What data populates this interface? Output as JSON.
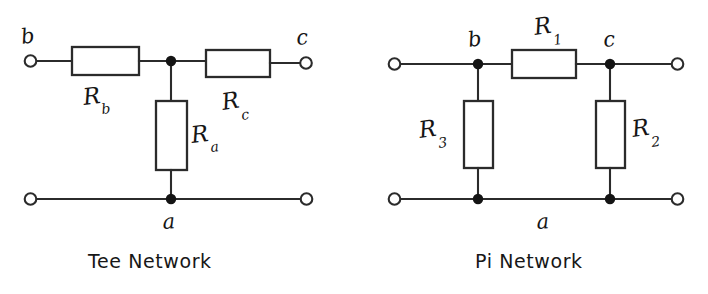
{
  "figure": {
    "background_color": "#ffffff",
    "ink_color": "#2b2b2b"
  },
  "networks": [
    {
      "id": "tee",
      "caption": "Tee Network",
      "node_labels": [
        {
          "name": "b",
          "text": "b",
          "x": 28,
          "y": 44
        },
        {
          "name": "c",
          "text": "c",
          "x": 300,
          "y": 44
        },
        {
          "name": "a",
          "text": "a",
          "x": 162,
          "y": 228
        }
      ],
      "resistors": [
        {
          "name": "Rb",
          "base": "R",
          "sub": "b",
          "orientation": "horizontal"
        },
        {
          "name": "Rc",
          "base": "R",
          "sub": "c",
          "orientation": "horizontal"
        },
        {
          "name": "Ra",
          "base": "R",
          "sub": "a",
          "orientation": "vertical"
        }
      ],
      "terminals": 4
    },
    {
      "id": "pi",
      "caption": "Pi Network",
      "node_labels": [
        {
          "name": "b",
          "text": "b",
          "x": 470,
          "y": 44
        },
        {
          "name": "c",
          "text": "c",
          "x": 604,
          "y": 44
        },
        {
          "name": "a",
          "text": "a",
          "x": 537,
          "y": 228
        }
      ],
      "resistors": [
        {
          "name": "R1",
          "base": "R",
          "sub": "1",
          "orientation": "horizontal"
        },
        {
          "name": "R3",
          "base": "R",
          "sub": "3",
          "orientation": "vertical"
        },
        {
          "name": "R2",
          "base": "R",
          "sub": "2",
          "orientation": "vertical"
        }
      ],
      "terminals": 4
    }
  ],
  "labels": {
    "tee_b": "b",
    "tee_c": "c",
    "tee_a": "a",
    "tee_Rb_base": "R",
    "tee_Rb_sub": "b",
    "tee_Rc_base": "R",
    "tee_Rc_sub": "c",
    "tee_Ra_base": "R",
    "tee_Ra_sub": "a",
    "pi_b": "b",
    "pi_c": "c",
    "pi_a": "a",
    "pi_R1_base": "R",
    "pi_R1_sub": "1",
    "pi_R3_base": "R",
    "pi_R3_sub": "3",
    "pi_R2_base": "R",
    "pi_R2_sub": "2"
  },
  "captions": {
    "tee": "Tee Network",
    "pi": "Pi Network"
  }
}
